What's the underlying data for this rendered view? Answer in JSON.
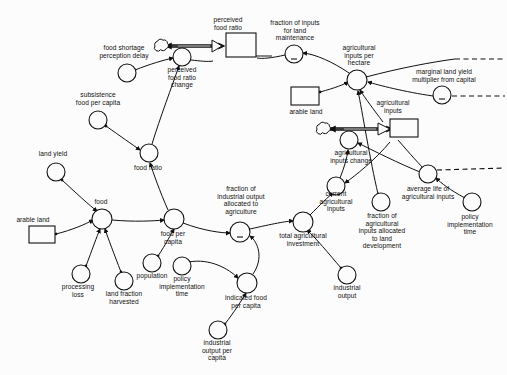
{
  "diagram": {
    "type": "stock-and-flow",
    "ink_color": "#111111",
    "background_color": "#fcfcfc",
    "width": 507,
    "height": 375
  },
  "stocks": [
    {
      "id": "perceived_food_ratio",
      "label": "perceived\nfood ratio",
      "x": 226,
      "y": 45,
      "w": 30,
      "h": 24,
      "label_x": 228,
      "label_y": 22
    },
    {
      "id": "arable_land_top",
      "label": "arable land",
      "x": 305,
      "y": 96,
      "w": 28,
      "h": 18,
      "label_x": 306,
      "label_y": 113
    },
    {
      "id": "agricultural_inputs",
      "label": "agricultural\ninputs",
      "x": 394,
      "y": 128,
      "w": 28,
      "h": 18,
      "label_x": 393,
      "label_y": 104
    },
    {
      "id": "arable_land_left",
      "label": "arable land",
      "x": 42,
      "y": 235,
      "w": 26,
      "h": 17,
      "label_x": 33,
      "label_y": 221
    }
  ],
  "flows": [
    {
      "id": "perceived_food_ratio_change",
      "label": "perceived\nfood ratio\nchange",
      "x": 182,
      "y": 57,
      "r": 9,
      "label_x": 182,
      "label_y": 70,
      "cloud_x": 160,
      "cloud_y": 46
    },
    {
      "id": "agricultural_inputs_change",
      "label": "agricultural\ninputs change",
      "x": 349,
      "y": 140,
      "r": 9,
      "label_x": 351,
      "label_y": 153,
      "cloud_x": 323,
      "cloud_y": 128
    }
  ],
  "auxiliaries": [
    {
      "id": "food_shortage_perception_delay",
      "label": "food shortage\nperception delay",
      "x": 127,
      "y": 73,
      "r": 9,
      "label_x": 124,
      "label_y": 50,
      "sign": ""
    },
    {
      "id": "subsistence_food_per_capita",
      "label": "subsistence\nfood per capita",
      "x": 98,
      "y": 120,
      "r": 9,
      "label_x": 98,
      "label_y": 97,
      "sign": ""
    },
    {
      "id": "food_ratio",
      "label": "food ratio",
      "x": 149,
      "y": 153,
      "r": 9,
      "label_x": 148,
      "label_y": 168,
      "sign": ""
    },
    {
      "id": "land_yield",
      "label": "land yield",
      "x": 56,
      "y": 172,
      "r": 9,
      "label_x": 53,
      "label_y": 156,
      "sign": ""
    },
    {
      "id": "food",
      "label": "food",
      "x": 102,
      "y": 219,
      "r": 10,
      "label_x": 101,
      "label_y": 204,
      "sign": ""
    },
    {
      "id": "processing_loss",
      "label": "processing\nloss",
      "x": 81,
      "y": 274,
      "r": 9,
      "label_x": 78,
      "label_y": 287,
      "sign": ""
    },
    {
      "id": "land_fraction_harvested",
      "label": "land fraction\nharvested",
      "x": 124,
      "y": 281,
      "r": 9,
      "label_x": 124,
      "label_y": 293,
      "sign": ""
    },
    {
      "id": "food_per_capita",
      "label": "food per\ncapita",
      "x": 174,
      "y": 219,
      "r": 10,
      "label_x": 173,
      "label_y": 232,
      "sign": ""
    },
    {
      "id": "population",
      "label": "population",
      "x": 152,
      "y": 263,
      "r": 9,
      "label_x": 152,
      "label_y": 276,
      "sign": ""
    },
    {
      "id": "policy_implementation_time_left",
      "label": "policy\nimplementation\ntime",
      "x": 182,
      "y": 266,
      "r": 9,
      "label_x": 182,
      "label_y": 278,
      "sign": ""
    },
    {
      "id": "indicated_food_per_capita",
      "label": "indicated food\nper capita",
      "x": 247,
      "y": 283,
      "r": 10,
      "label_x": 246,
      "label_y": 296,
      "sign": ""
    },
    {
      "id": "industrial_output_per_capita",
      "label": "industrial\noutput per\ncapita",
      "x": 218,
      "y": 330,
      "r": 9,
      "label_x": 217,
      "label_y": 342,
      "sign": ""
    },
    {
      "id": "fraction_of_industrial_output_allocated_to_agriculture",
      "label": "fraction of\nindustrial output\nallocated to\nagriculture",
      "x": 240,
      "y": 232,
      "r": 10,
      "label_x": 241,
      "label_y": 186,
      "sign": "-"
    },
    {
      "id": "total_agricultural_investment",
      "label": "total agricultural\ninvestment",
      "x": 303,
      "y": 222,
      "r": 10,
      "label_x": 303,
      "label_y": 234,
      "sign": ""
    },
    {
      "id": "industrial_output",
      "label": "industrial\noutput",
      "x": 347,
      "y": 275,
      "r": 9,
      "label_x": 347,
      "label_y": 287,
      "sign": ""
    },
    {
      "id": "current_agricultural_inputs",
      "label": "current\nagricultural\ninputs",
      "x": 336,
      "y": 186,
      "r": 9,
      "label_x": 336,
      "label_y": 192,
      "sign": ""
    },
    {
      "id": "fraction_of_agricultural_inputs_allocated_to_land_development",
      "label": "fraction of\nagricultural\ninputs allocated\nto land\ndevelopment",
      "x": 381,
      "y": 202,
      "r": 9,
      "label_x": 382,
      "label_y": 214,
      "sign": ""
    },
    {
      "id": "average_life_of_agricultural_inputs",
      "label": "average life of\nagricultural inputs",
      "x": 428,
      "y": 174,
      "r": 9,
      "label_x": 428,
      "label_y": 186,
      "sign": ""
    },
    {
      "id": "policy_implementation_time_right",
      "label": "policy\nimplementation\ntime",
      "x": 472,
      "y": 202,
      "r": 9,
      "label_x": 470,
      "label_y": 214,
      "sign": ""
    },
    {
      "id": "fraction_of_inputs_for_land_maintenance",
      "label": "fraction of inputs\nfor land\nmaintenance",
      "x": 294,
      "y": 54,
      "r": 9,
      "label_x": 295,
      "label_y": 22,
      "sign": "-"
    },
    {
      "id": "agricultural_inputs_per_hectare",
      "label": "agricultural\ninputs per\nhectare",
      "x": 357,
      "y": 80,
      "r": 10,
      "label_x": 359,
      "label_y": 47,
      "sign": ""
    },
    {
      "id": "marginal_land_yield_multiplier_from_capital",
      "label": "marginal land yield\nmultiplier from capital",
      "x": 442,
      "y": 95,
      "r": 9,
      "label_x": 444,
      "label_y": 72,
      "sign": "-"
    }
  ],
  "link_count": 27
}
